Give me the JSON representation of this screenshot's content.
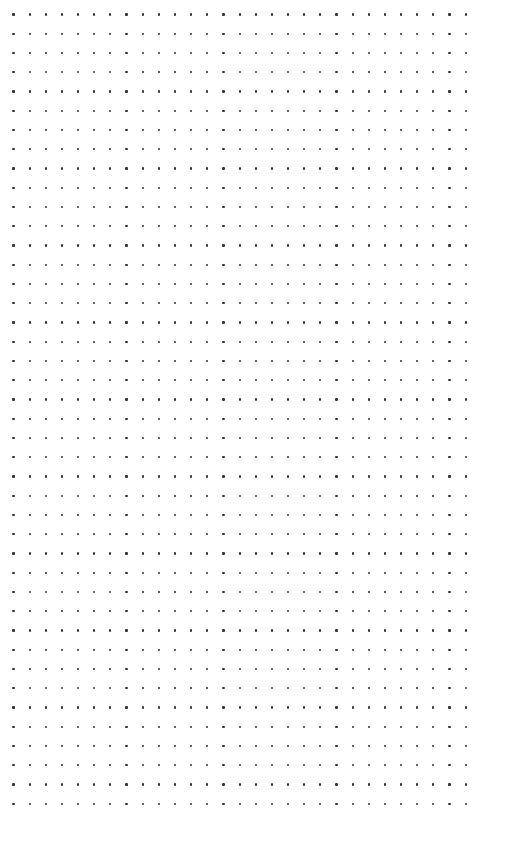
{
  "page": {
    "type": "dot-grid-paper",
    "background": "#ffffff",
    "dot_color": "#333333"
  },
  "grid": {
    "columns": 29,
    "rows": 42,
    "origin_x": 13.5,
    "origin_y": 14.5,
    "spacing_x": 16.15,
    "spacing_y": 19.25,
    "dot_size": 2.2
  }
}
